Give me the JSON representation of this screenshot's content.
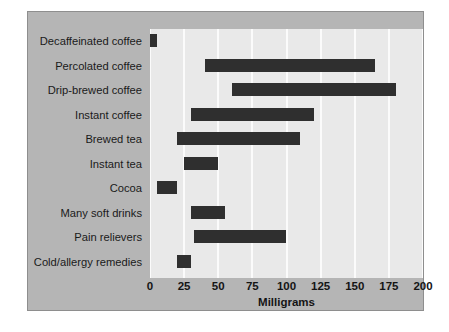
{
  "chart_data": {
    "type": "bar",
    "orientation": "horizontal",
    "subtype": "range-bar",
    "title": "",
    "xlabel": "Milligrams",
    "ylabel": "",
    "xlim": [
      0,
      200
    ],
    "xticks": [
      0,
      25,
      50,
      75,
      100,
      125,
      150,
      175,
      200
    ],
    "xticklabels": [
      "0",
      "25",
      "50",
      "75",
      "100",
      "125",
      "150",
      "175",
      "200"
    ],
    "grid": "vertical",
    "legend": "none",
    "categories": [
      "Decaffeinated coffee",
      "Percolated coffee",
      "Drip-brewed coffee",
      "Instant coffee",
      "Brewed tea",
      "Instant tea",
      "Cocoa",
      "Many soft drinks",
      "Pain relievers",
      "Cold/allergy remedies"
    ],
    "ranges": [
      {
        "category": "Decaffeinated coffee",
        "start": 0,
        "end": 5
      },
      {
        "category": "Percolated coffee",
        "start": 40,
        "end": 165
      },
      {
        "category": "Drip-brewed coffee",
        "start": 60,
        "end": 180
      },
      {
        "category": "Instant coffee",
        "start": 30,
        "end": 120
      },
      {
        "category": "Brewed tea",
        "start": 20,
        "end": 110
      },
      {
        "category": "Instant tea",
        "start": 25,
        "end": 50
      },
      {
        "category": "Cocoa",
        "start": 5,
        "end": 20
      },
      {
        "category": "Many soft drinks",
        "start": 30,
        "end": 55
      },
      {
        "category": "Pain relievers",
        "start": 32,
        "end": 100
      },
      {
        "category": "Cold/allergy remedies",
        "start": 20,
        "end": 30
      }
    ],
    "colors": {
      "bar": "#2f2f2f",
      "plot_background": "#e9e9e9",
      "panel_background": "#b5b5b5",
      "gridline": "#fbfbfb",
      "text": "#141414"
    }
  }
}
